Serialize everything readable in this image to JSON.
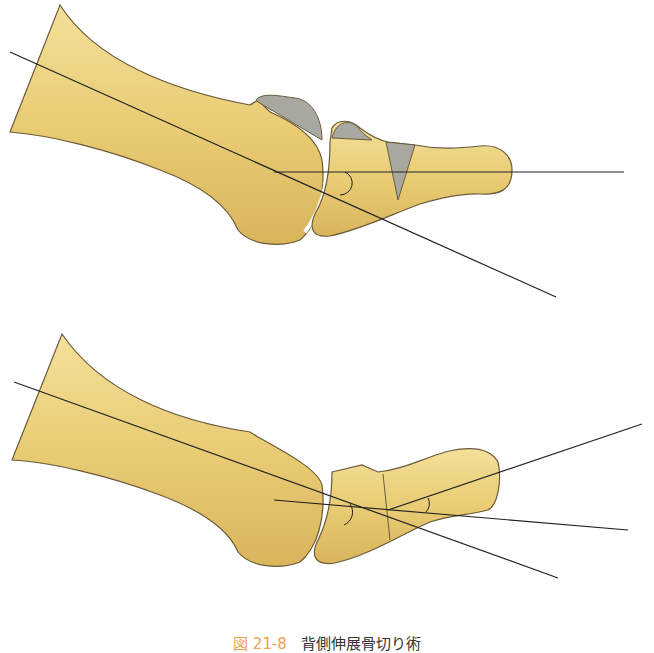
{
  "figure": {
    "caption_number": "図 21-8",
    "caption_text": "背側伸展骨切り術",
    "panels": [
      {
        "name": "before",
        "description": "Bone with dorsal wedge resection regions (gray) and axis lines"
      },
      {
        "name": "after",
        "description": "Bone after dorsal extension osteotomy with realigned axis lines"
      }
    ],
    "colors": {
      "bone_fill": "#ecd27e",
      "bone_shade": "#d8b45a",
      "bone_outline": "#6b5a3a",
      "wedge_fill": "#a8a8a0",
      "line": "#222222",
      "caption_number": "#f0a050"
    }
  }
}
